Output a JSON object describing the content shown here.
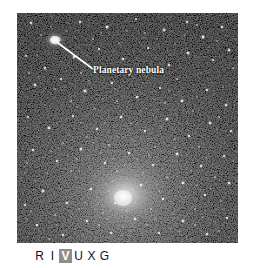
{
  "figure": {
    "type": "astronomical-photograph",
    "background_color": "#ffffff"
  },
  "photo": {
    "alt": "dense globular star cluster field",
    "frame_color": "#050505",
    "core": {
      "center_x_pct": 49,
      "center_y_pct": 80,
      "glow_color": "#f2f2f2"
    }
  },
  "annotation": {
    "label": "Planetary nebula",
    "label_color": "#ffffff",
    "leader_line_color": "#ffffff",
    "leader_from_x": 41,
    "leader_from_y": 30,
    "leader_to_x": 76,
    "leader_to_y": 56,
    "target_x": 38,
    "target_y": 27
  },
  "spectrum": {
    "name": "RIVUXG electromagnetic band indicator",
    "active_band": "V",
    "active_background": "#8e8e8e",
    "active_color": "#ffffff",
    "letter_color": "#111111",
    "letters": [
      {
        "id": "radio",
        "label": "R",
        "active": false
      },
      {
        "id": "infrared",
        "label": "I",
        "active": false
      },
      {
        "id": "visible",
        "label": "V",
        "active": true
      },
      {
        "id": "ultraviolet",
        "label": "U",
        "active": false
      },
      {
        "id": "xray",
        "label": "X",
        "active": false
      },
      {
        "id": "gamma",
        "label": "G",
        "active": false
      }
    ]
  }
}
